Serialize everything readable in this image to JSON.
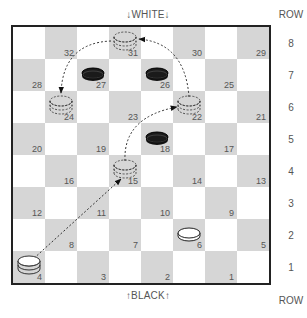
{
  "header": {
    "top_label": "↓WHITE↓",
    "bottom_label": "↑BLACK↑",
    "row_header": "ROW"
  },
  "rows": [
    "8",
    "7",
    "6",
    "5",
    "4",
    "3",
    "2",
    "1"
  ],
  "squares": [
    {
      "n": "32",
      "row": 8,
      "col": 2
    },
    {
      "n": "31",
      "row": 8,
      "col": 4
    },
    {
      "n": "30",
      "row": 8,
      "col": 6
    },
    {
      "n": "29",
      "row": 8,
      "col": 8
    },
    {
      "n": "28",
      "row": 7,
      "col": 1
    },
    {
      "n": "27",
      "row": 7,
      "col": 3
    },
    {
      "n": "26",
      "row": 7,
      "col": 5
    },
    {
      "n": "25",
      "row": 7,
      "col": 7
    },
    {
      "n": "24",
      "row": 6,
      "col": 2
    },
    {
      "n": "23",
      "row": 6,
      "col": 4
    },
    {
      "n": "22",
      "row": 6,
      "col": 6
    },
    {
      "n": "21",
      "row": 6,
      "col": 8
    },
    {
      "n": "20",
      "row": 5,
      "col": 1
    },
    {
      "n": "19",
      "row": 5,
      "col": 3
    },
    {
      "n": "18",
      "row": 5,
      "col": 5
    },
    {
      "n": "17",
      "row": 5,
      "col": 7
    },
    {
      "n": "16",
      "row": 4,
      "col": 2
    },
    {
      "n": "15",
      "row": 4,
      "col": 4
    },
    {
      "n": "14",
      "row": 4,
      "col": 6
    },
    {
      "n": "13",
      "row": 4,
      "col": 8
    },
    {
      "n": "12",
      "row": 3,
      "col": 1
    },
    {
      "n": "11",
      "row": 3,
      "col": 3
    },
    {
      "n": "10",
      "row": 3,
      "col": 5
    },
    {
      "n": "9",
      "row": 3,
      "col": 7
    },
    {
      "n": "8",
      "row": 2,
      "col": 2
    },
    {
      "n": "7",
      "row": 2,
      "col": 4
    },
    {
      "n": "6",
      "row": 2,
      "col": 6
    },
    {
      "n": "5",
      "row": 2,
      "col": 8
    },
    {
      "n": "4",
      "row": 1,
      "col": 1
    },
    {
      "n": "3",
      "row": 1,
      "col": 3
    },
    {
      "n": "2",
      "row": 1,
      "col": 5
    },
    {
      "n": "1",
      "row": 1,
      "col": 7
    }
  ],
  "pieces": [
    {
      "square": "4",
      "type": "white-king"
    },
    {
      "square": "6",
      "type": "white-man"
    },
    {
      "square": "27",
      "type": "black-man"
    },
    {
      "square": "26",
      "type": "black-man"
    },
    {
      "square": "18",
      "type": "black-man"
    },
    {
      "square": "15",
      "type": "ghost-king"
    },
    {
      "square": "22",
      "type": "ghost-king"
    },
    {
      "square": "31",
      "type": "ghost-king"
    },
    {
      "square": "24",
      "type": "ghost-king"
    }
  ],
  "moves": [
    {
      "from": "4",
      "to": "15"
    },
    {
      "from": "15",
      "to": "22"
    },
    {
      "from": "22",
      "to": "31"
    },
    {
      "from": "31",
      "to": "24"
    }
  ],
  "colors": {
    "dark_square": "#d6d6d6",
    "light_square": "#ffffff",
    "border": "#222222",
    "black_piece": "#1a1a1a"
  }
}
